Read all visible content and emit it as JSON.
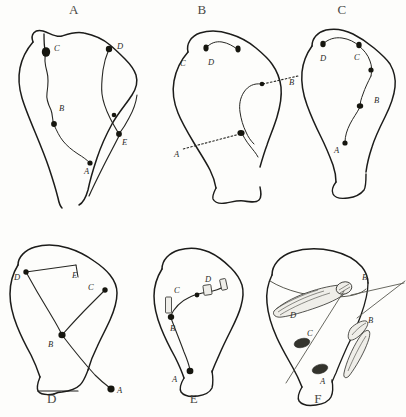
{
  "figure": {
    "type": "scientific-illustration-plate",
    "background_color": "#fdfdfb",
    "ink_color": "#1c1c1a",
    "panel_count": 6,
    "rows": 2,
    "columns": 3
  },
  "panels": [
    {
      "id": "A",
      "title": "A",
      "title_position": {
        "x": 74,
        "y": 4
      },
      "labels": [
        {
          "text": "C",
          "x": 54,
          "y": 48
        },
        {
          "text": "D",
          "x": 117,
          "y": 48
        },
        {
          "text": "B",
          "x": 59,
          "y": 106
        },
        {
          "text": "E",
          "x": 122,
          "y": 140
        },
        {
          "text": "A",
          "x": 86,
          "y": 168
        }
      ]
    },
    {
      "id": "B",
      "title": "B",
      "title_position": {
        "x": 190,
        "y": 4
      },
      "labels": [
        {
          "text": "C",
          "x": 180,
          "y": 62
        },
        {
          "text": "D",
          "x": 208,
          "y": 62
        },
        {
          "text": "B",
          "x": 289,
          "y": 84
        },
        {
          "text": "A",
          "x": 176,
          "y": 152
        }
      ]
    },
    {
      "id": "C",
      "title": "C",
      "title_position": {
        "x": 330,
        "y": 4
      },
      "labels": [
        {
          "text": "D",
          "x": 322,
          "y": 58
        },
        {
          "text": "C",
          "x": 352,
          "y": 56
        },
        {
          "text": "B",
          "x": 370,
          "y": 98
        },
        {
          "text": "A",
          "x": 341,
          "y": 148
        }
      ]
    },
    {
      "id": "D",
      "title": "D",
      "title_position": {
        "x": 52,
        "y": 396
      },
      "labels": [
        {
          "text": "D",
          "x": 14,
          "y": 268
        },
        {
          "text": "E",
          "x": 72,
          "y": 262
        },
        {
          "text": "C",
          "x": 88,
          "y": 280
        },
        {
          "text": "B",
          "x": 48,
          "y": 333
        },
        {
          "text": "A",
          "x": 117,
          "y": 364
        }
      ]
    },
    {
      "id": "E",
      "title": "E",
      "title_position": {
        "x": 182,
        "y": 396
      },
      "labels": [
        {
          "text": "C",
          "x": 174,
          "y": 288
        },
        {
          "text": "D",
          "x": 205,
          "y": 280
        },
        {
          "text": "B",
          "x": 170,
          "y": 314
        },
        {
          "text": "A",
          "x": 172,
          "y": 371
        }
      ]
    },
    {
      "id": "F",
      "title": "F",
      "title_position": {
        "x": 318,
        "y": 396
      },
      "labels": [
        {
          "text": "D",
          "x": 290,
          "y": 285
        },
        {
          "text": "B",
          "x": 362,
          "y": 258
        },
        {
          "text": "C",
          "x": 307,
          "y": 305
        },
        {
          "text": "B",
          "x": 368,
          "y": 294
        },
        {
          "text": "A",
          "x": 320,
          "y": 362
        }
      ]
    }
  ]
}
